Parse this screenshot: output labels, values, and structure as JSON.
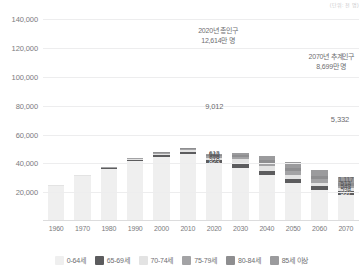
{
  "unit_note": "(단위: 천 명)",
  "chart_data": {
    "type": "bar",
    "title": "",
    "subtitle": "",
    "xlabel": "",
    "ylabel": "",
    "stacked": true,
    "grid": true,
    "legend_position": "bottom",
    "ylim": [
      0,
      145000
    ],
    "yticks": [
      20000,
      40000,
      60000,
      80000,
      100000,
      120000,
      140000
    ],
    "ytick_labels": [
      "20,000",
      "40,000",
      "60,000",
      "80,000",
      "100,000",
      "120,000",
      "140,000"
    ],
    "categories": [
      "1960",
      "1970",
      "1980",
      "1990",
      "2000",
      "2010",
      "2020",
      "2030",
      "2040",
      "2050",
      "2060",
      "2070"
    ],
    "series": [
      {
        "name": "0-64세",
        "color": "#efefef",
        "values": [
          24300,
          31000,
          36000,
          41500,
          44600,
          46300,
          40120,
          36900,
          31800,
          26200,
          21400,
          18300
        ]
      },
      {
        "name": "65-69세",
        "color": "#5c5c5e",
        "values": [
          320,
          420,
          620,
          900,
          1280,
          1600,
          2130,
          3200,
          3200,
          3100,
          2600,
          2200
        ]
      },
      {
        "name": "70-74세",
        "color": "#e3e3e3",
        "values": [
          210,
          290,
          430,
          660,
          960,
          1230,
          1640,
          2600,
          3000,
          2950,
          2500,
          2100
        ]
      },
      {
        "name": "75-79세",
        "color": "#a3a3a5",
        "values": [
          130,
          180,
          280,
          440,
          660,
          900,
          1250,
          1900,
          2600,
          2700,
          2350,
          2050
        ]
      },
      {
        "name": "80-84세",
        "color": "#8e8e90",
        "values": [
          60,
          90,
          150,
          240,
          380,
          560,
          840,
          1300,
          1900,
          2200,
          2100,
          1850
        ]
      },
      {
        "name": "85세 이상",
        "color": "#9b9b9d",
        "values": [
          30,
          50,
          90,
          150,
          260,
          420,
          780,
          1400,
          2600,
          3800,
          4500,
          4400
        ]
      }
    ],
    "bar_totals": [
      25050,
      32030,
      37570,
      43890,
      48140,
      51010,
      46760,
      47300,
      45100,
      40950,
      35450,
      30900
    ],
    "point_labels_2020": [
      {
        "series": "65-69세",
        "value": "823",
        "on_dark": true
      },
      {
        "series": "70-74세",
        "value": "918",
        "on_dark": false
      },
      {
        "series": "75-79세",
        "value": "706",
        "on_dark": false
      },
      {
        "series": "80-84세",
        "value": "540",
        "on_dark": false
      },
      {
        "series": "85세 이상",
        "value": "613",
        "on_dark": false
      }
    ],
    "point_labels_2070": [
      {
        "series": "65-69세",
        "value": "597",
        "on_dark": true
      },
      {
        "series": "70-74세",
        "value": "594",
        "on_dark": false
      },
      {
        "series": "75-79세",
        "value": "548",
        "on_dark": false
      },
      {
        "series": "80-84세",
        "value": "514",
        "on_dark": false
      },
      {
        "series": "85세 이상",
        "value": "1,117",
        "on_dark": false
      }
    ],
    "annotations": [
      {
        "id": "total-2020",
        "line1": "2020년 총인구",
        "line2": "12,614만 명"
      },
      {
        "id": "total-2070",
        "line1": "2070년 추계인구",
        "line2": "8,699만 명"
      },
      {
        "id": "youth-2020",
        "value": "9,012"
      },
      {
        "id": "youth-2070",
        "value": "5,332"
      }
    ]
  }
}
